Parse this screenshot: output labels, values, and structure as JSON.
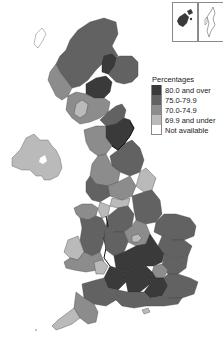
{
  "map": {
    "type": "choropleth",
    "region": "United Kingdom",
    "insets": [
      {
        "name": "Orkney",
        "category": "80.0 and over"
      },
      {
        "name": "Shetland",
        "category": "Not available"
      }
    ]
  },
  "legend": {
    "title": "Percentages",
    "items": [
      {
        "label": "80.0 and over",
        "color": "#3a3a3a"
      },
      {
        "label": "75.0-79.9",
        "color": "#626262"
      },
      {
        "label": "70.0-74.9",
        "color": "#8c8c8c"
      },
      {
        "label": "69.9 and under",
        "color": "#bababa"
      },
      {
        "label": "Not available",
        "color": "#ffffff"
      }
    ]
  },
  "colors": {
    "c80": "#3a3a3a",
    "c75": "#626262",
    "c70": "#8c8c8c",
    "c69": "#bababa",
    "na": "#ffffff",
    "border": "#111111"
  }
}
